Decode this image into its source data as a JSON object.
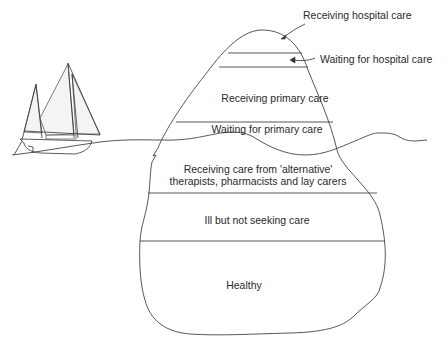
{
  "diagram": {
    "type": "iceberg",
    "layers": [
      {
        "id": "receiving_hospital_care",
        "label": "Receiving hospital care",
        "position": "callout-top"
      },
      {
        "id": "waiting_hospital_care",
        "label": "Waiting for hospital care",
        "position": "callout-right"
      },
      {
        "id": "receiving_primary_care",
        "label": "Receiving primary care"
      },
      {
        "id": "waiting_primary_care",
        "label": "Waiting for primary care"
      },
      {
        "id": "alternative_care",
        "label_line1": "Receiving care from 'alternative'",
        "label_line2": "therapists, pharmacists and lay carers"
      },
      {
        "id": "ill_not_seeking",
        "label": "Ill but not seeking care"
      },
      {
        "id": "healthy",
        "label": "Healthy"
      }
    ],
    "elements": {
      "boat": "sailing-boat-illustration",
      "waterline": "wavy-sea-line"
    },
    "colors": {
      "line": "#444444",
      "text": "#2a2a2a",
      "background": "#ffffff"
    }
  }
}
